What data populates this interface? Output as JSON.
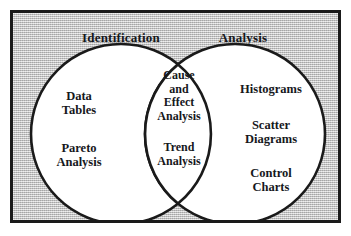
{
  "diagram": {
    "type": "venn",
    "sets": [
      {
        "name": "Identification",
        "heading": "Identification",
        "items": [
          "Data\nTables",
          "Pareto\nAnalysis"
        ]
      },
      {
        "name": "Analysis",
        "heading": "Analysis",
        "items": [
          "Histograms",
          "Scatter\nDiagrams",
          "Control\nCharts"
        ]
      }
    ],
    "intersection": {
      "items": [
        "Cause\nand\nEffect\nAnalysis",
        "Trend\nAnalysis"
      ]
    },
    "labels": {
      "heading_left": "Identification",
      "heading_right": "Analysis",
      "left_item_1": "Data\nTables",
      "left_item_2": "Pareto\nAnalysis",
      "mid_item_1": "Cause\nand\nEffect\nAnalysis",
      "mid_item_2": "Trend\nAnalysis",
      "right_item_1": "Histograms",
      "right_item_2": "Scatter\nDiagrams",
      "right_item_3": "Control\nCharts"
    },
    "colors": {
      "background": "#ffffff",
      "panel_fill": "#c2c2c2",
      "frame_stroke": "#1a1a1a",
      "circle_fill": "#ffffff",
      "circle_stroke": "#1a1a1a",
      "text": "#16181c"
    }
  }
}
